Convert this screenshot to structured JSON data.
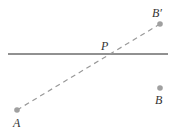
{
  "diagram": {
    "title": "",
    "line": {
      "label": "",
      "x1": 8,
      "y1": 54,
      "x2": 168,
      "y2": 54,
      "color": "#222222"
    },
    "dashed_segment": {
      "from": "A",
      "to": "B′",
      "color": "#999999"
    },
    "points": [
      {
        "id": "A",
        "label": "A",
        "x": 17,
        "y": 110,
        "label_x": 13,
        "label_y": 127
      },
      {
        "id": "B",
        "label": "B",
        "x": 160,
        "y": 88,
        "label_x": 155,
        "label_y": 104
      },
      {
        "id": "Bprime",
        "label": "B′",
        "x": 160,
        "y": 24,
        "label_x": 152,
        "label_y": 17
      },
      {
        "id": "P",
        "label": "P",
        "x": 108,
        "y": 54,
        "label_x": 101,
        "label_y": 50
      }
    ],
    "point_color": "#a0a0a0"
  }
}
